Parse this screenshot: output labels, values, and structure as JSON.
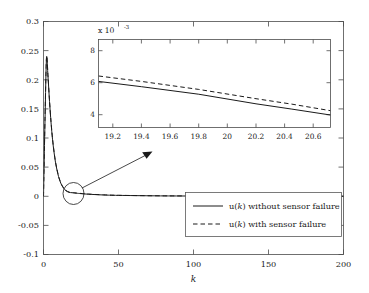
{
  "chart_data": {
    "type": "line",
    "title": "",
    "xlabel": "k",
    "ylabel": "",
    "xlim": [
      0,
      200
    ],
    "ylim": [
      -0.1,
      0.3
    ],
    "xticks": [
      "0",
      "50",
      "100",
      "150",
      "200"
    ],
    "xtick_values": [
      0,
      50,
      100,
      150,
      200
    ],
    "yticks": [
      "-0.1",
      "-0.05",
      "0",
      "0.05",
      "0.1",
      "0.15",
      "0.2",
      "0.25",
      "0.3"
    ],
    "ytick_values": [
      -0.1,
      -0.05,
      0,
      0.05,
      0.1,
      0.15,
      0.2,
      0.25,
      0.3
    ],
    "grid": false,
    "legend_position": "lower right",
    "legend": [
      {
        "label_prefix": "u",
        "label_var": "k",
        "label_suffix": ") without sensor failure",
        "style": "solid"
      },
      {
        "label_prefix": "u",
        "label_var": "k",
        "label_suffix": ") with sensor failure",
        "style": "dashed"
      }
    ],
    "series": [
      {
        "name": "u(k) without sensor failure",
        "style": "solid",
        "x": [
          0,
          1,
          2,
          3,
          4,
          5,
          6,
          7,
          8,
          9,
          10,
          11,
          12,
          13,
          14,
          15,
          16,
          17,
          18,
          19,
          20,
          22,
          25,
          30,
          40,
          50,
          75,
          100,
          150,
          200
        ],
        "y": [
          0.0,
          0.13,
          0.237,
          0.205,
          0.163,
          0.127,
          0.098,
          0.076,
          0.058,
          0.045,
          0.034,
          0.026,
          0.0198,
          0.0152,
          0.0118,
          0.0094,
          0.0078,
          0.0068,
          0.0063,
          0.0061,
          0.0058,
          0.0052,
          0.0045,
          0.0035,
          0.0022,
          0.0015,
          0.0007,
          0.0004,
          0.0002,
          0.0001
        ]
      },
      {
        "name": "u(k) with sensor failure",
        "style": "dashed",
        "x": [
          0,
          1,
          2,
          3,
          4,
          5,
          6,
          7,
          8,
          9,
          10,
          11,
          12,
          13,
          14,
          15,
          16,
          17,
          18,
          19,
          20,
          22,
          25,
          30,
          40,
          50,
          75,
          100,
          150,
          200
        ],
        "y": [
          0.0,
          0.134,
          0.2385,
          0.2065,
          0.1645,
          0.1285,
          0.0995,
          0.0772,
          0.0592,
          0.046,
          0.0348,
          0.0268,
          0.0206,
          0.0159,
          0.0124,
          0.0099,
          0.0083,
          0.0072,
          0.0067,
          0.0064,
          0.0061,
          0.0055,
          0.0048,
          0.0037,
          0.0024,
          0.0016,
          0.0008,
          0.0005,
          0.0002,
          0.0001
        ]
      }
    ],
    "annotations": [
      {
        "type": "ellipse",
        "x": 20,
        "y": 0.0,
        "note": "zoom highlight circle around curve near k=20"
      },
      {
        "type": "arrow",
        "from_x": 22.5,
        "from_y": 0.004,
        "to_x": 38,
        "to_y": 0.062,
        "note": "arrow from highlight circle to inset"
      }
    ],
    "inset": {
      "type": "line",
      "xlim": [
        19.1,
        20.72
      ],
      "ylim": [
        3.2,
        8.7
      ],
      "y_multiplier": "x 10",
      "y_multiplier_exponent": "-3",
      "xticks": [
        "19.2",
        "19.4",
        "19.6",
        "19.8",
        "20",
        "20.2",
        "20.4",
        "20.6"
      ],
      "xtick_values": [
        19.2,
        19.4,
        19.6,
        19.8,
        20.0,
        20.2,
        20.4,
        20.6
      ],
      "yticks": [
        "4",
        "6",
        "8"
      ],
      "ytick_values": [
        4,
        6,
        8
      ],
      "grid": false,
      "series": [
        {
          "name": "u(k) without sensor failure",
          "style": "solid",
          "x": [
            19.1,
            19.4,
            19.8,
            20.2,
            20.45,
            20.72
          ],
          "y": [
            6.08,
            5.75,
            5.28,
            4.68,
            4.35,
            3.98
          ]
        },
        {
          "name": "u(k) with sensor failure",
          "style": "dashed",
          "x": [
            19.1,
            19.4,
            19.8,
            20.2,
            20.45,
            20.72
          ],
          "y": [
            6.42,
            6.08,
            5.58,
            5.0,
            4.66,
            4.25
          ]
        }
      ]
    },
    "colors": {
      "line": "#1a1a1a",
      "axis": "#4d4d4d",
      "background": "#ffffff"
    }
  }
}
